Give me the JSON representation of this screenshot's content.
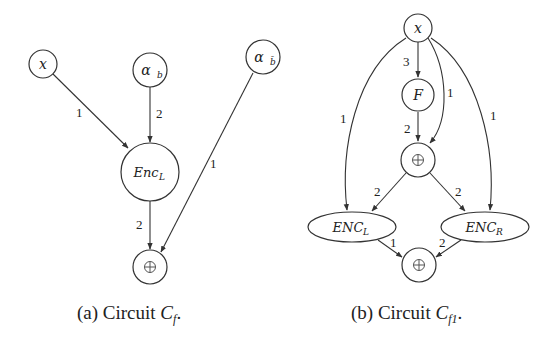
{
  "figure": {
    "panels": [
      {
        "id": "a",
        "caption": {
          "prefix": "(a) Circuit ",
          "symbol": "C",
          "subscript": "f",
          "suffix": "."
        },
        "nodes": [
          {
            "id": "x",
            "label": "x",
            "shape": "circle"
          },
          {
            "id": "alpha_b",
            "label": "α",
            "sub": "b",
            "shape": "circle"
          },
          {
            "id": "alpha_bbar",
            "label": "α",
            "sub": "b̄",
            "shape": "circle"
          },
          {
            "id": "enc_l",
            "label": "Enc",
            "sub": "L",
            "shape": "circle"
          },
          {
            "id": "xor",
            "label": "⊕",
            "shape": "circle"
          }
        ],
        "edges": [
          {
            "from": "x",
            "to": "enc_l",
            "label": "1"
          },
          {
            "from": "alpha_b",
            "to": "enc_l",
            "label": "2"
          },
          {
            "from": "alpha_bbar",
            "to": "xor",
            "label": "1"
          },
          {
            "from": "enc_l",
            "to": "xor",
            "label": "2"
          }
        ]
      },
      {
        "id": "b",
        "caption": {
          "prefix": "(b) Circuit ",
          "symbol": "C",
          "subscript": "f1",
          "suffix": "."
        },
        "nodes": [
          {
            "id": "x",
            "label": "x",
            "shape": "circle"
          },
          {
            "id": "F",
            "label": "F",
            "shape": "circle"
          },
          {
            "id": "xor_mid",
            "label": "⊕",
            "shape": "circle"
          },
          {
            "id": "enc_l",
            "label": "ENC",
            "sub": "L",
            "shape": "ellipse"
          },
          {
            "id": "enc_r",
            "label": "ENC",
            "sub": "R",
            "shape": "ellipse"
          },
          {
            "id": "xor_out",
            "label": "⊕",
            "shape": "circle"
          }
        ],
        "edges": [
          {
            "from": "x",
            "to": "F",
            "label": "3"
          },
          {
            "from": "x",
            "to": "xor_mid",
            "label": "1"
          },
          {
            "from": "x",
            "to": "enc_l",
            "label": "1"
          },
          {
            "from": "x",
            "to": "enc_r",
            "label": "1"
          },
          {
            "from": "F",
            "to": "xor_mid",
            "label": "2"
          },
          {
            "from": "xor_mid",
            "to": "enc_l",
            "label": "2"
          },
          {
            "from": "xor_mid",
            "to": "enc_r",
            "label": "2"
          },
          {
            "from": "enc_l",
            "to": "xor_out",
            "label": "1"
          },
          {
            "from": "enc_r",
            "to": "xor_out",
            "label": "2"
          }
        ]
      }
    ]
  }
}
